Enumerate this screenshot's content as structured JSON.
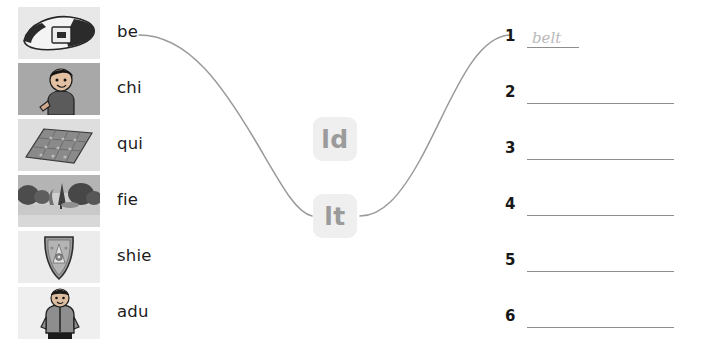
{
  "exercise": {
    "type": "match-syllable-to-ending",
    "word_bank": [
      {
        "syllable": "be",
        "picture": "belt-picture"
      },
      {
        "syllable": "chi",
        "picture": "child-picture"
      },
      {
        "syllable": "qui",
        "picture": "quilt-picture"
      },
      {
        "syllable": "fie",
        "picture": "field-picture"
      },
      {
        "syllable": "shie",
        "picture": "shield-picture"
      },
      {
        "syllable": "adu",
        "picture": "adult-picture"
      }
    ],
    "endings": [
      {
        "label": "ld",
        "id": "tile-ld"
      },
      {
        "label": "lt",
        "id": "tile-lt"
      }
    ],
    "answers": [
      {
        "number": "1",
        "value": "belt",
        "filled": true
      },
      {
        "number": "2",
        "value": "",
        "filled": false
      },
      {
        "number": "3",
        "value": "",
        "filled": false
      },
      {
        "number": "4",
        "value": "",
        "filled": false
      },
      {
        "number": "5",
        "value": "",
        "filled": false
      },
      {
        "number": "6",
        "value": "",
        "filled": false
      }
    ],
    "connections": [
      {
        "from": "be",
        "to": "lt"
      },
      {
        "from": "lt",
        "to": "1"
      }
    ]
  },
  "colors": {
    "page_background": "#ffffff",
    "tile_background": "#efefef",
    "tile_text": "#9b9b9b",
    "rule_line": "#8d8d8d",
    "connector_line": "#9a9a9a",
    "answer_text": "#b9b9b9",
    "body_text": "#1a1a1a"
  }
}
